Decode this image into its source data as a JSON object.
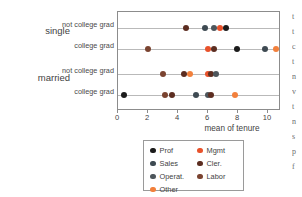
{
  "chart_data": {
    "type": "scatter",
    "title": "",
    "xlabel": "mean of tenure",
    "ylabel": "",
    "xlim": [
      -0.5,
      11.0
    ],
    "xticks": [
      0,
      2,
      4,
      6,
      8,
      10
    ],
    "xtick_labels": [
      "0",
      "2",
      "4",
      "6",
      "8",
      "10"
    ],
    "grid": "horizontal-row-lines",
    "legend_position": "below-plot",
    "groups": [
      {
        "label": "single",
        "rows": [
          {
            "label": "not college grad",
            "points": [
              {
                "series": "Cler.",
                "value": 4.5
              },
              {
                "series": "Sales",
                "value": 5.8
              },
              {
                "series": "Operat.",
                "value": 6.4
              },
              {
                "series": "Mgmt",
                "value": 6.8
              },
              {
                "series": "Prof",
                "value": 7.2
              }
            ]
          },
          {
            "label": "college grad",
            "points": [
              {
                "series": "Labor",
                "value": 2.0
              },
              {
                "series": "Mgmt",
                "value": 6.0
              },
              {
                "series": "Cler.",
                "value": 6.4
              },
              {
                "series": "Prof",
                "value": 7.9
              },
              {
                "series": "Sales",
                "value": 9.8
              },
              {
                "series": "Other",
                "value": 10.5
              }
            ]
          }
        ]
      },
      {
        "label": "married",
        "rows": [
          {
            "label": "not college grad",
            "points": [
              {
                "series": "Labor",
                "value": 3.0
              },
              {
                "series": "Cler.",
                "value": 4.4
              },
              {
                "series": "Other",
                "value": 4.8
              },
              {
                "series": "Mgmt",
                "value": 6.0
              },
              {
                "series": "Cler.",
                "value": 6.2
              },
              {
                "series": "Operat.",
                "value": 6.5
              }
            ]
          },
          {
            "label": "college grad",
            "points": [
              {
                "series": "Prof",
                "value": 0.4
              },
              {
                "series": "Labor",
                "value": 3.1
              },
              {
                "series": "Cler.",
                "value": 3.6
              },
              {
                "series": "Sales",
                "value": 5.2
              },
              {
                "series": "Operat.",
                "value": 6.0
              },
              {
                "series": "Cler.",
                "value": 6.2
              },
              {
                "series": "Other",
                "value": 7.8
              }
            ]
          }
        ]
      }
    ],
    "series_legend": [
      {
        "name": "Prof",
        "color": "#1b1b1b"
      },
      {
        "name": "Sales",
        "color": "#3e4a52"
      },
      {
        "name": "Operat.",
        "color": "#4d565c"
      },
      {
        "name": "Other",
        "color": "#f2803c"
      },
      {
        "name": "Mgmt",
        "color": "#e8522b"
      },
      {
        "name": "Cler.",
        "color": "#5c2d20"
      },
      {
        "name": "Labor",
        "color": "#7a4330"
      }
    ]
  },
  "legend": {
    "columns": [
      [
        "Prof",
        "Sales",
        "Operat.",
        "Other"
      ],
      [
        "Mgmt",
        "Cler.",
        "Labor"
      ]
    ]
  },
  "axis": {
    "title": "mean of tenure",
    "tick_labels": [
      "0",
      "2",
      "4",
      "6",
      "8",
      "10"
    ]
  },
  "edge_text": [
    "t",
    "t",
    "c",
    "t",
    "n",
    "v",
    "t",
    "n",
    "s",
    "p",
    "f"
  ]
}
